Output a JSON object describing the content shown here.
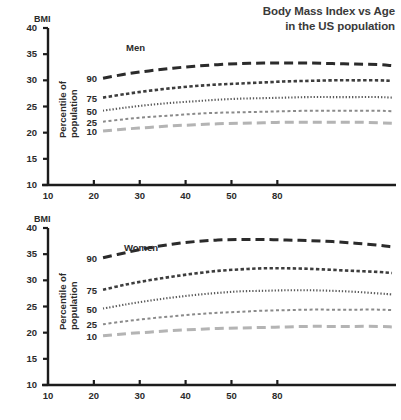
{
  "title": {
    "line1": "Body Mass Index vs Age",
    "line2": "in the US population"
  },
  "axes": {
    "y_name": "BMI",
    "y_ticks": [
      "40",
      "35",
      "30",
      "25",
      "20",
      "15",
      "10"
    ],
    "x_ticks": [
      "10",
      "20",
      "30",
      "40",
      "50",
      "80"
    ],
    "percentile_axis_line1": "Percentile of",
    "percentile_axis_line2": "population",
    "percentile_labels": [
      "90",
      "75",
      "50",
      "25",
      "10"
    ]
  },
  "panels": [
    {
      "key": "men",
      "label": "Men"
    },
    {
      "key": "women",
      "label": "Women"
    }
  ],
  "colors": {
    "p90": "#2b2b2b",
    "p75": "#3d3d3d",
    "p50": "#5a5a5a",
    "p25": "#8a8a8a",
    "p10": "#b4b4b4",
    "axis": "#1c1c1c",
    "text": "#2b2b2b"
  },
  "chart_data": {
    "type": "line",
    "title": "Body Mass Index vs Age in the US population",
    "xlabel": "",
    "ylabel": "BMI",
    "xlim": [
      10,
      85
    ],
    "ylim": [
      10,
      40
    ],
    "grid": false,
    "legend": "inline-percentile-labels",
    "panels": [
      {
        "name": "Men",
        "x": [
          22,
          27,
          32,
          37,
          42,
          47,
          52,
          57,
          62,
          67,
          72,
          77,
          82,
          85
        ],
        "series": [
          {
            "name": "90",
            "percentile": 90,
            "dash": "long-dash",
            "color": "#2b2b2b",
            "values": [
              30.4,
              31.2,
              31.8,
              32.3,
              32.7,
              33.0,
              33.2,
              33.3,
              33.3,
              33.3,
              33.2,
              33.1,
              33.0,
              32.8
            ]
          },
          {
            "name": "75",
            "percentile": 75,
            "dash": "medium-dash",
            "color": "#3d3d3d",
            "values": [
              26.7,
              27.4,
              28.0,
              28.5,
              28.9,
              29.2,
              29.4,
              29.6,
              29.8,
              29.9,
              30.0,
              30.0,
              30.0,
              29.9
            ]
          },
          {
            "name": "50",
            "percentile": 50,
            "dash": "dotted",
            "color": "#5a5a5a",
            "values": [
              24.2,
              24.8,
              25.3,
              25.7,
              26.0,
              26.3,
              26.5,
              26.6,
              26.7,
              26.8,
              26.8,
              26.8,
              26.8,
              26.7
            ]
          },
          {
            "name": "25",
            "percentile": 25,
            "dash": "short-dash",
            "color": "#8a8a8a",
            "values": [
              22.1,
              22.6,
              23.0,
              23.3,
              23.6,
              23.8,
              23.9,
              24.0,
              24.1,
              24.2,
              24.2,
              24.2,
              24.2,
              24.1
            ]
          },
          {
            "name": "10",
            "percentile": 10,
            "dash": "long-dash",
            "color": "#b4b4b4",
            "values": [
              20.3,
              20.7,
              21.0,
              21.3,
              21.5,
              21.7,
              21.8,
              21.9,
              22.0,
              22.0,
              22.0,
              22.0,
              21.9,
              21.8
            ]
          }
        ]
      },
      {
        "name": "Women",
        "x": [
          22,
          27,
          32,
          37,
          42,
          47,
          52,
          57,
          62,
          67,
          72,
          77,
          82,
          85
        ],
        "series": [
          {
            "name": "90",
            "percentile": 90,
            "dash": "long-dash",
            "color": "#2b2b2b",
            "values": [
              34.3,
              35.3,
              36.2,
              36.9,
              37.4,
              37.7,
              37.8,
              37.8,
              37.7,
              37.6,
              37.4,
              37.1,
              36.7,
              36.4
            ]
          },
          {
            "name": "75",
            "percentile": 75,
            "dash": "medium-dash",
            "color": "#3d3d3d",
            "values": [
              28.2,
              29.2,
              30.0,
              30.7,
              31.3,
              31.8,
              32.1,
              32.3,
              32.3,
              32.2,
              32.0,
              31.8,
              31.6,
              31.4
            ]
          },
          {
            "name": "50",
            "percentile": 50,
            "dash": "dotted",
            "color": "#5a5a5a",
            "values": [
              24.6,
              25.4,
              26.1,
              26.7,
              27.2,
              27.6,
              27.9,
              28.0,
              28.1,
              28.1,
              28.0,
              27.8,
              27.5,
              27.3
            ]
          },
          {
            "name": "25",
            "percentile": 25,
            "dash": "short-dash",
            "color": "#8a8a8a",
            "values": [
              21.6,
              22.2,
              22.7,
              23.1,
              23.5,
              23.8,
              24.0,
              24.2,
              24.3,
              24.4,
              24.4,
              24.4,
              24.4,
              24.3
            ]
          },
          {
            "name": "10",
            "percentile": 10,
            "dash": "long-dash",
            "color": "#b4b4b4",
            "values": [
              19.4,
              19.8,
              20.1,
              20.4,
              20.6,
              20.8,
              20.9,
              21.0,
              21.1,
              21.2,
              21.2,
              21.2,
              21.2,
              21.1
            ]
          }
        ]
      }
    ]
  }
}
